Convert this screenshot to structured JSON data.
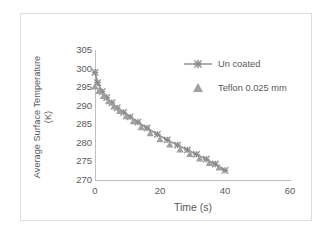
{
  "chart_data": {
    "type": "line",
    "title": "",
    "xlabel": "Time (s)",
    "ylabel": "Average Surface Temperature (K)",
    "ylabel_line1": "Average Surface Temperature",
    "ylabel_line2": "(K)",
    "xlim": [
      0,
      60
    ],
    "ylim": [
      270,
      305
    ],
    "xticks": [
      0,
      20,
      40,
      60
    ],
    "xtick_labels": [
      "0",
      "20",
      "40",
      "60"
    ],
    "yticks": [
      270,
      275,
      280,
      285,
      290,
      295,
      300,
      305
    ],
    "ytick_labels": [
      "305",
      "300",
      "295",
      "290",
      "285",
      "280",
      "275",
      "270"
    ],
    "grid": false,
    "legend_position": "upper right",
    "series": [
      {
        "name": "Un coated",
        "marker": "x",
        "line": "solid",
        "color": "#8c8c8c",
        "x": [
          0,
          0.8,
          2.2,
          3.6,
          5.2,
          6.8,
          8.8,
          10.8,
          13.2,
          16.0,
          19.2,
          22.2,
          25.4,
          28.4,
          31.2,
          34.2,
          37.0,
          40.0
        ],
        "y": [
          299.0,
          296.2,
          293.8,
          292.2,
          290.8,
          289.4,
          288.2,
          287.0,
          285.6,
          284.0,
          282.3,
          280.8,
          279.4,
          278.1,
          276.9,
          275.6,
          274.3,
          272.6
        ]
      },
      {
        "name": "Teflon 0.025 mm",
        "marker": "triangle",
        "line": "none",
        "color": "#a0a0a0",
        "x": [
          0,
          1.2,
          2.6,
          4.2,
          5.8,
          7.6,
          9.6,
          11.8,
          14.2,
          17.0,
          20.0,
          23.0,
          26.2,
          29.2,
          32.2,
          35.2,
          38.2
        ],
        "y": [
          295.2,
          294.0,
          292.6,
          291.2,
          289.8,
          288.6,
          287.2,
          285.8,
          284.2,
          282.6,
          281.0,
          279.6,
          278.2,
          277.0,
          275.8,
          274.6,
          273.4
        ]
      }
    ],
    "colors": {
      "line": "#8c8c8c",
      "marker": "#8c8c8c",
      "triangle": "#a0a0a0",
      "axis": "#bfbfbf",
      "text": "#595959",
      "frame": "#dddddd",
      "background": "#ffffff"
    }
  },
  "legend": {
    "items": [
      {
        "label": "Un coated",
        "marker": "line-x-marker"
      },
      {
        "label": "Teflon 0.025 mm",
        "marker": "triangle-marker"
      }
    ]
  }
}
